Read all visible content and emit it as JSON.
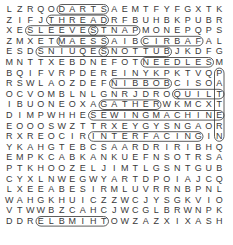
{
  "puzzle": {
    "type": "word-search",
    "columns": 21,
    "rows": [
      "LZRQODARTSAEMTFYFGXTK",
      "ZIFJTHREADRFBUHBKPUBR",
      "XESLEEVESTNAPMONEPQPS",
      "ZMXETMAESSAIBCIRBAFAL",
      "ESDSNIUQESNOTTUBJKDFG",
      "MNTTXEBDNEFOTNEEDLESM",
      "BQIFVRPDEREINYKPKTVQP",
      "RSWLAOZDEFNIBBOBCISOA",
      "OCVOMBLNLGNRJDROQUILT",
      "IBUONEOXAGATHERWKMCXT",
      "DIMPWHHESEWINGMACHINE",
      "EOOOSWZTTRXEYGYSNGAOR",
      "RXREOCIRINTERFACINGIN",
      "YKAHGTEBCSAARDRIRIBHQ",
      "EMPKCABKANKUEFNSOTRSA",
      "PTKHOOZELJIMTLGSNTGUB",
      "CYXLNWEGWYARTDPOIAJCQ",
      "LXEEABESIRMLUVRRNBPNL",
      "WAHGKHUICZZWCJYSGKVIO",
      "VTWWBZCAHCJWCGLBRWNPK",
      "DDRELBMIHTOWZAZXIXASH"
    ],
    "found_words": [
      {
        "word": "DARTS",
        "row": 0,
        "col": 5,
        "dir": "horizontal"
      },
      {
        "word": "THREAD",
        "row": 1,
        "col": 4,
        "dir": "horizontal"
      },
      {
        "word": "SLEEVES",
        "row": 2,
        "col": 2,
        "dir": "horizontal"
      },
      {
        "word": "PANTS",
        "row": 2,
        "col": 12,
        "dir": "horizontal-reverse"
      },
      {
        "word": "SEAMS",
        "row": 3,
        "col": 9,
        "dir": "horizontal-reverse"
      },
      {
        "word": "FABRIC",
        "row": 3,
        "col": 18,
        "dir": "horizontal-reverse"
      },
      {
        "word": "SEQUINS",
        "row": 4,
        "col": 9,
        "dir": "horizontal-reverse"
      },
      {
        "word": "BUTTONS",
        "row": 4,
        "col": 15,
        "dir": "horizontal-reverse"
      },
      {
        "word": "NEEDLES",
        "row": 5,
        "col": 13,
        "dir": "horizontal"
      },
      {
        "word": "BOBBIN",
        "row": 7,
        "col": 15,
        "dir": "horizontal-reverse"
      },
      {
        "word": "QUILT",
        "row": 8,
        "col": 16,
        "dir": "horizontal"
      },
      {
        "word": "GATHER",
        "row": 9,
        "col": 9,
        "dir": "horizontal"
      },
      {
        "word": "SEWINGMACHINE",
        "row": 10,
        "col": 8,
        "dir": "horizontal"
      },
      {
        "word": "INTERFACING",
        "row": 12,
        "col": 8,
        "dir": "horizontal"
      },
      {
        "word": "THIMBLE",
        "row": 20,
        "col": 9,
        "dir": "horizontal-reverse"
      },
      {
        "word": "PATTERN",
        "row": 6,
        "col": 20,
        "dir": "vertical"
      }
    ]
  }
}
